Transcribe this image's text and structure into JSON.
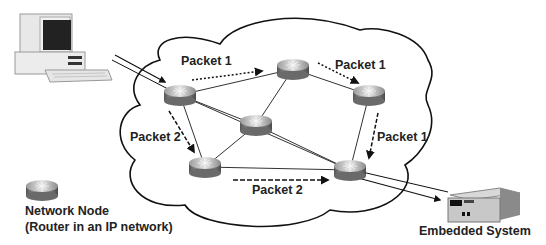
{
  "diagram": {
    "type": "network-packet-routing",
    "cloud": {
      "name": "IP network"
    },
    "source": {
      "name": "computer-icon"
    },
    "destination": {
      "label": "Embedded System"
    },
    "routers": [
      {
        "id": "R1",
        "x": 180,
        "y": 95
      },
      {
        "id": "R2",
        "x": 293,
        "y": 69
      },
      {
        "id": "R3",
        "x": 256,
        "y": 125
      },
      {
        "id": "R4",
        "x": 369,
        "y": 95
      },
      {
        "id": "R5",
        "x": 205,
        "y": 167
      },
      {
        "id": "R6",
        "x": 350,
        "y": 170
      }
    ],
    "links": [
      [
        "R1",
        "R2"
      ],
      [
        "R1",
        "R3"
      ],
      [
        "R1",
        "R5"
      ],
      [
        "R2",
        "R3"
      ],
      [
        "R2",
        "R4"
      ],
      [
        "R3",
        "R5"
      ],
      [
        "R3",
        "R6"
      ],
      [
        "R4",
        "R6"
      ],
      [
        "R5",
        "R6"
      ],
      [
        "R1",
        "R6"
      ]
    ],
    "packet_labels": {
      "p1_top": "Packet 1",
      "p1_right_top": "Packet 1",
      "p1_right": "Packet 1",
      "p2_left": "Packet 2",
      "p2_bottom": "Packet 2"
    },
    "legend": {
      "title": "Network Node",
      "subtitle": "(Router in an IP network)"
    }
  }
}
